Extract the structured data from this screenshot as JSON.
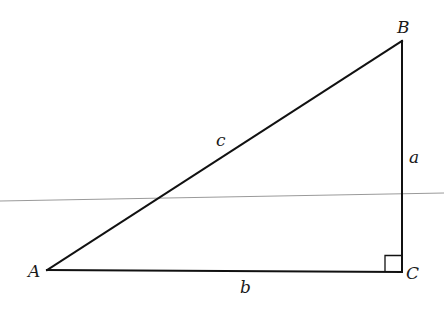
{
  "diagram": {
    "type": "right-triangle",
    "colors": {
      "stroke": "#111111",
      "label": "#1a1a1a",
      "background": "#ffffff",
      "scan_line": "#9a9a9a"
    },
    "vertices": [
      {
        "id": "A",
        "label": "A",
        "x": 47,
        "y": 270
      },
      {
        "id": "B",
        "label": "B",
        "x": 402,
        "y": 41
      },
      {
        "id": "C",
        "label": "C",
        "x": 402,
        "y": 272
      }
    ],
    "sides": [
      {
        "id": "a",
        "label": "a",
        "from": "B",
        "to": "C"
      },
      {
        "id": "b",
        "label": "b",
        "from": "A",
        "to": "C"
      },
      {
        "id": "c",
        "label": "c",
        "from": "A",
        "to": "B"
      }
    ],
    "right_angle_at": "C"
  },
  "labels": {
    "A": "A",
    "B": "B",
    "C": "C",
    "a": "a",
    "b": "b",
    "c": "c"
  }
}
